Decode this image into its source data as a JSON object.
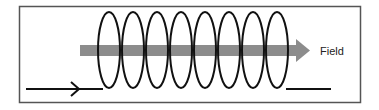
{
  "diagram": {
    "type": "solenoid",
    "field_label": "Field",
    "coil_count": 8,
    "colors": {
      "frame": "#555555",
      "wire": "#111111",
      "field_arrow": "#8c8c8c",
      "background": "#ffffff"
    }
  }
}
